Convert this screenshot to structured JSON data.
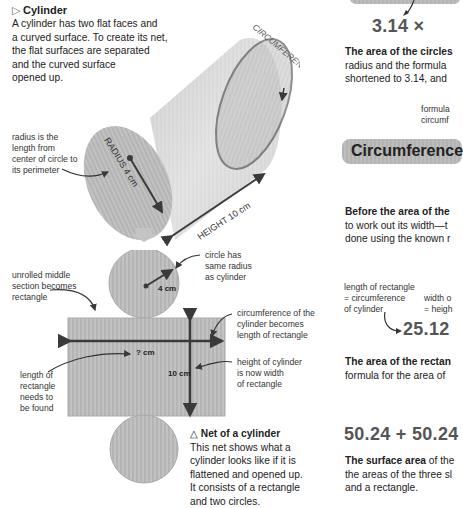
{
  "cylinder_section": {
    "marker": "▷",
    "title": "Cylinder",
    "description_lines": [
      "A cylinder has two flat faces and",
      "a curved surface. To create its net,",
      "the flat surfaces are separated",
      "and the curved surface",
      "opened up."
    ],
    "labels": {
      "circumference": "CIRCUMFERENCE",
      "radius": "RADIUS 4 cm",
      "height": "HEIGHT 10 cm"
    },
    "radius_note_lines": [
      "radius is the",
      "length from",
      "center of circle to",
      "its perimeter"
    ]
  },
  "net_section": {
    "unrolled_note_lines": [
      "unrolled middle",
      "section becomes",
      "rectangle"
    ],
    "circle_note_lines": [
      "circle has",
      "same radius",
      "as cylinder"
    ],
    "radius_label": "4 cm",
    "circumference_note_lines": [
      "circumference of the",
      "cylinder becomes",
      "length of rectangle"
    ],
    "length_label": "? cm",
    "height_label": "10 cm",
    "height_note_lines": [
      "height of cylinder",
      "is now width",
      "of rectangle"
    ],
    "length_note_lines": [
      "length of",
      "rectangle",
      "needs to",
      "be found"
    ],
    "caption_marker": "△",
    "caption_title": "Net of a cylinder",
    "caption_lines": [
      "This net shows what a",
      "cylinder looks like if it is",
      "flattened and opened up.",
      "It consists of a rectangle",
      "and two circles."
    ]
  },
  "right_column": {
    "formula_top": "3.14 ×",
    "circles_bold": "The area of the circles",
    "circles_lines": [
      "radius and the formula",
      "shortened to 3.14, and"
    ],
    "formula_note_lines": [
      "formula",
      "circumf"
    ],
    "pill_title": "Circumference",
    "before_bold": "Before the area of the",
    "before_lines": [
      "to work out its width—t",
      "done using the known r"
    ],
    "length_rect_lines": [
      "length of rectangle",
      "= circumference",
      "of cylinder"
    ],
    "width_lines": [
      "width o",
      "= heigh"
    ],
    "result_num": "25.12",
    "rect_bold": "The area of the rectan",
    "rect_lines": [
      "formula for the area of"
    ],
    "sum_formula": "50.24 + 50.24",
    "surface_bold": "The surface area",
    "surface_rest": " of the",
    "surface_lines": [
      "the areas of the three sl",
      "and a rectangle."
    ]
  },
  "colors": {
    "shape_fill": "#bdbdbd",
    "stripe": "#b0b0b0",
    "arrow": "#3a3a3a",
    "pill": "#b8b8b8",
    "big_number": "#555555"
  }
}
